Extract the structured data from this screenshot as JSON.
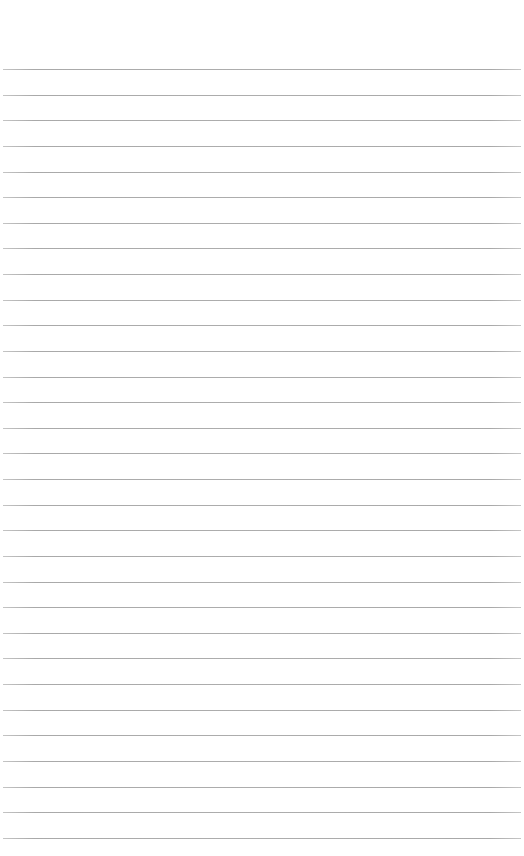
{
  "page": {
    "type": "lined-paper",
    "background_color": "#ffffff",
    "rule_color": "#aaaaaa",
    "rule_count": 31,
    "first_rule_y": 69,
    "rule_spacing": 25.63,
    "rule_left": 3,
    "rule_right": 521,
    "text_lines": []
  }
}
